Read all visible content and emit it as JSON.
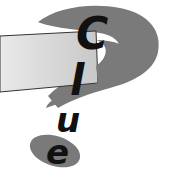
{
  "logo": {
    "word": "Clue",
    "letters": [
      "C",
      "l",
      "u",
      "e"
    ],
    "colors": {
      "question_mark": "#7a7a7a",
      "band_light": "#e6e6e6",
      "band_dark": "#c4c4c4",
      "band_outline": "#333333",
      "letters": "#111111",
      "background": "#ffffff"
    }
  }
}
